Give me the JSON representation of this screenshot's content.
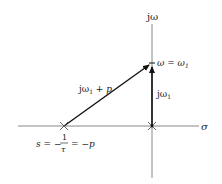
{
  "diagram": {
    "type": "s-plane vector diagram",
    "axes": {
      "horizontal_label": "σ",
      "vertical_label": "jω"
    },
    "points": {
      "pole_label_lhs": "s = −",
      "pole_frac_num": "1",
      "pole_frac_den": "τ",
      "pole_label_rhs": "= −p",
      "omega_point_label": "ω = ω",
      "omega_point_sub": "1"
    },
    "vectors": {
      "diagonal_label": "jω",
      "diagonal_sub": "1",
      "diagonal_rest": " + p",
      "vertical_label": "jω",
      "vertical_sub": "1"
    },
    "colors": {
      "axis": "#888888",
      "vector": "#111111",
      "text": "#222222"
    }
  }
}
